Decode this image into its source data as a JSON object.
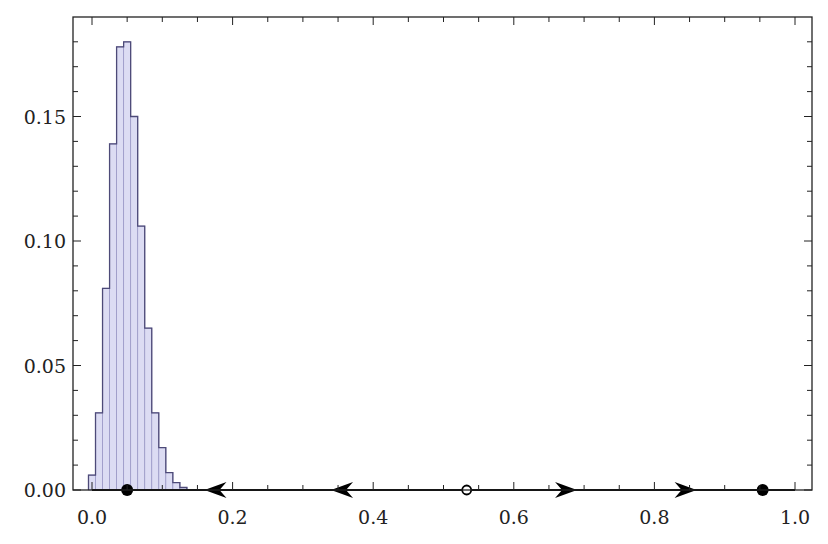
{
  "chart_data": {
    "type": "bar",
    "subtype": "histogram",
    "title": "",
    "xlabel": "",
    "ylabel": "",
    "xlim": [
      -0.027,
      1.025
    ],
    "ylim": [
      0.0,
      0.189
    ],
    "grid": false,
    "legend": null,
    "x_ticks": [
      0.0,
      0.2,
      0.4,
      0.6,
      0.8,
      1.0
    ],
    "x_tick_labels": [
      "0.0",
      "0.2",
      "0.4",
      "0.6",
      "0.8",
      "1.0"
    ],
    "x_minor_step": 0.05,
    "y_ticks": [
      0.0,
      0.05,
      0.1,
      0.15
    ],
    "y_tick_labels": [
      "0.00",
      "0.05",
      "0.10",
      "0.15"
    ],
    "y_minor_step": 0.01,
    "bin_width": 0.01,
    "bins": [
      {
        "left": -0.005,
        "value": 0.006
      },
      {
        "left": 0.005,
        "value": 0.031
      },
      {
        "left": 0.015,
        "value": 0.081
      },
      {
        "left": 0.025,
        "value": 0.139
      },
      {
        "left": 0.035,
        "value": 0.178
      },
      {
        "left": 0.045,
        "value": 0.18
      },
      {
        "left": 0.055,
        "value": 0.15
      },
      {
        "left": 0.065,
        "value": 0.106
      },
      {
        "left": 0.075,
        "value": 0.065
      },
      {
        "left": 0.085,
        "value": 0.031
      },
      {
        "left": 0.095,
        "value": 0.017
      },
      {
        "left": 0.105,
        "value": 0.007
      },
      {
        "left": 0.115,
        "value": 0.003
      },
      {
        "left": 0.125,
        "value": 0.001
      }
    ],
    "annotations": {
      "fixed_points": [
        {
          "x": 0.05,
          "type": "stable",
          "filled": true
        },
        {
          "x": 0.533,
          "type": "unstable",
          "filled": false
        },
        {
          "x": 0.954,
          "type": "stable",
          "filled": true
        }
      ],
      "flow_arrows": [
        {
          "x": 0.16,
          "direction": "left"
        },
        {
          "x": 0.34,
          "direction": "left"
        },
        {
          "x": 0.69,
          "direction": "right"
        },
        {
          "x": 0.86,
          "direction": "right"
        }
      ]
    },
    "colors": {
      "bar_fill": "#dcdcf3",
      "bar_divider": "#9a98c6",
      "bar_edge": "#4d4a78",
      "axis": "#222222",
      "flow_line": "#000000"
    }
  }
}
